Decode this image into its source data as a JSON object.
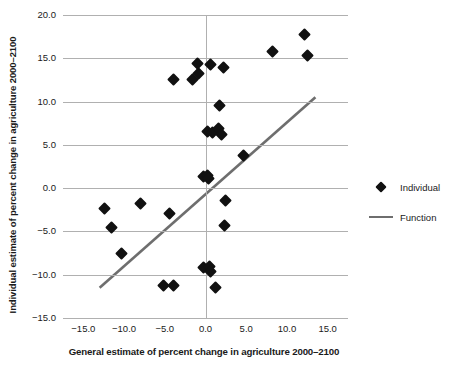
{
  "chart_data": {
    "type": "scatter",
    "title": "",
    "xlabel": "General estimate of percent change in agriculture 2000–2100",
    "ylabel": "Individual estimate of percent change in agriculture 2000–2100",
    "xlim": [
      -17.5,
      17.5
    ],
    "ylim": [
      -15.0,
      20.0
    ],
    "xticks": [
      -15.0,
      -10.0,
      -5.0,
      0.0,
      5.0,
      10.0,
      15.0
    ],
    "yticks": [
      -15.0,
      -10.0,
      -5.0,
      0.0,
      5.0,
      10.0,
      15.0,
      20.0
    ],
    "xtick_labels": [
      "-15.0",
      "-10.0",
      "-5.0",
      "0.0",
      "5.0",
      "10.0",
      "15.0"
    ],
    "ytick_labels": [
      "-15.0",
      "-10.0",
      "-5.0",
      "0.0",
      "5.0",
      "10.0",
      "15.0",
      "20.0"
    ],
    "grid": "horizontal",
    "legend_position": "right",
    "marker_color": "#111111",
    "line_color": "#6e6e6e",
    "grid_color": "#b0b0b0",
    "series": [
      {
        "name": "Individual",
        "type": "scatter",
        "marker": "diamond",
        "points": [
          [
            -3.9,
            12.5
          ],
          [
            -1.6,
            12.6
          ],
          [
            -0.9,
            13.3
          ],
          [
            -1.0,
            14.4
          ],
          [
            0.6,
            14.3
          ],
          [
            2.2,
            13.9
          ],
          [
            8.2,
            15.8
          ],
          [
            12.1,
            17.7
          ],
          [
            12.5,
            15.3
          ],
          [
            1.7,
            9.6
          ],
          [
            0.2,
            6.5
          ],
          [
            0.9,
            6.4
          ],
          [
            1.6,
            6.9
          ],
          [
            2.0,
            6.2
          ],
          [
            4.7,
            3.8
          ],
          [
            -0.3,
            1.3
          ],
          [
            0.2,
            1.5
          ],
          [
            0.4,
            1.1
          ],
          [
            2.4,
            -1.4
          ],
          [
            -12.4,
            -2.4
          ],
          [
            -8.0,
            -1.8
          ],
          [
            -4.4,
            -2.9
          ],
          [
            2.3,
            -4.3
          ],
          [
            -11.5,
            -4.6
          ],
          [
            -10.3,
            -7.5
          ],
          [
            -0.3,
            -9.2
          ],
          [
            0.5,
            -9.0
          ],
          [
            0.6,
            -9.6
          ],
          [
            -5.2,
            -11.2
          ],
          [
            -3.9,
            -11.2
          ],
          [
            1.2,
            -11.5
          ]
        ]
      },
      {
        "name": "Function",
        "type": "line",
        "points": [
          [
            -13.0,
            -11.5
          ],
          [
            13.5,
            10.5
          ]
        ]
      }
    ]
  },
  "legend": {
    "items": [
      {
        "label": "Individual",
        "swatch": "diamond-marker"
      },
      {
        "label": "Function",
        "swatch": "line-segment"
      }
    ]
  }
}
